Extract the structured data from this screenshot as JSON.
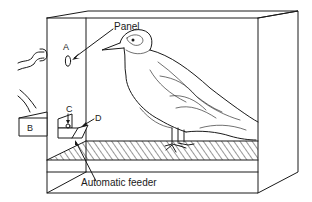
{
  "figure": {
    "labels": {
      "panel": "Panel",
      "a": "A",
      "b": "B",
      "c": "C",
      "d": "D",
      "feeder": "Automatic feeder"
    },
    "colors": {
      "line": "#1a1a1a",
      "background": "#ffffff"
    }
  }
}
